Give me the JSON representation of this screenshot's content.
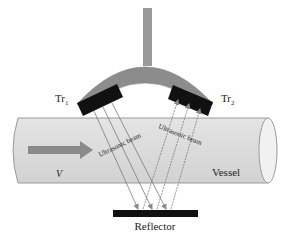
{
  "diagram": {
    "labels": {
      "transducer_1": "Tr",
      "transducer_1_sub": "1",
      "transducer_2": "Tr",
      "transducer_2_sub": "2",
      "beam_1": "Ultrasonic beam",
      "beam_2": "Ultrasonic beam",
      "velocity": "V",
      "vessel": "Vessel",
      "reflector": "Reflector"
    },
    "colors": {
      "housing": "#8c8c8c",
      "transducer": "#111111",
      "vessel_fill": "#d9d9d9",
      "vessel_stroke": "#9a9a9a",
      "flow_arrow": "#8a8a8a",
      "beam": "#7a7a7a",
      "reflector": "#111111"
    }
  }
}
